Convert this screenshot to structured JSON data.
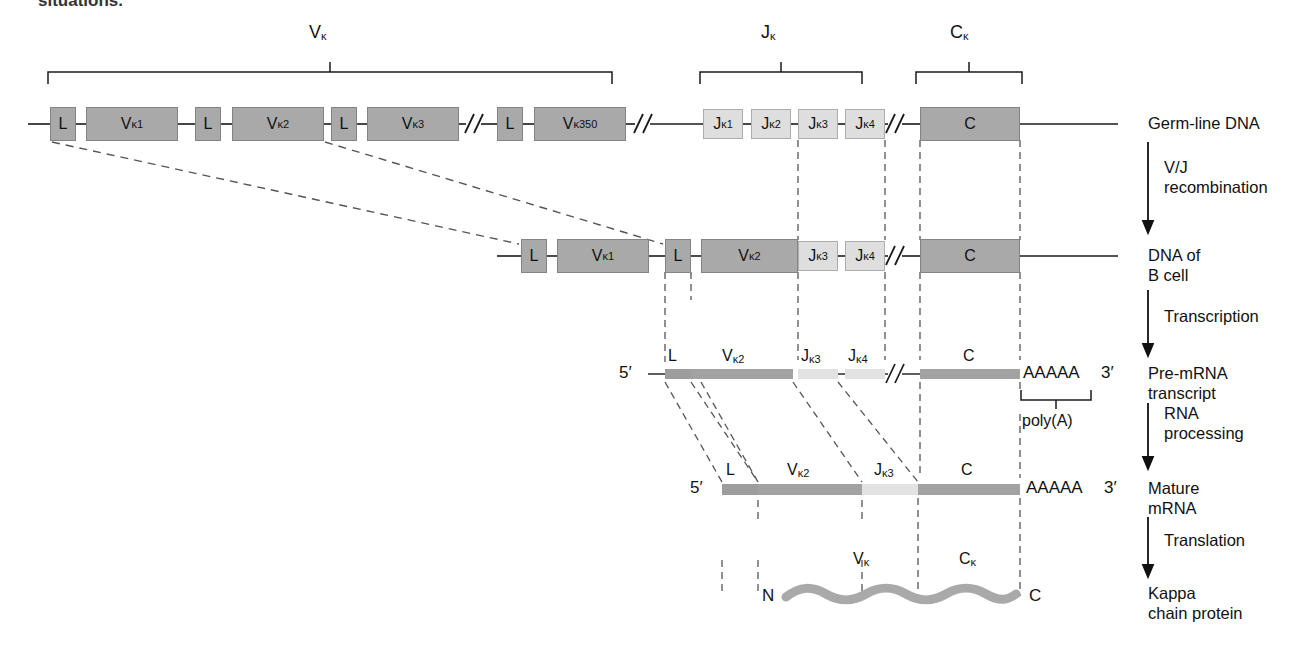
{
  "figure": {
    "page_fragment_top": "situations.",
    "kappa": "κ"
  },
  "brackets": [
    {
      "id": "v-bracket",
      "label": "V",
      "sub": "κ",
      "x1": 48,
      "x2": 612,
      "y": 72,
      "label_x": 316,
      "label_y": 30
    },
    {
      "id": "j-bracket",
      "label": "J",
      "sub": "κ",
      "x1": 700,
      "x2": 862,
      "y": 72,
      "label_x": 773,
      "label_y": 30
    },
    {
      "id": "c-bracket",
      "label": "C",
      "sub": "κ",
      "x1": 916,
      "x2": 1022,
      "y": 72,
      "label_x": 960,
      "label_y": 30
    },
    {
      "id": "polya-bracket",
      "label": "poly(A)",
      "sub": "",
      "x1": 1021,
      "x2": 1091,
      "y": 395,
      "label_x": 1026,
      "label_y": 408
    }
  ],
  "rows": [
    {
      "id": "germline-dna",
      "stage_label": "Germ-line DNA",
      "stage_label_lines": [
        "Germ-line DNA"
      ],
      "y": 124,
      "segments": [
        {
          "name": "L",
          "text": "L",
          "sub": "",
          "kind": "l",
          "x": 50,
          "w": 26,
          "h": 34
        },
        {
          "name": "Vk1",
          "text": "V",
          "sub": "κ1",
          "kind": "v",
          "x": 86,
          "w": 92,
          "h": 34
        },
        {
          "name": "L",
          "text": "L",
          "sub": "",
          "kind": "l",
          "x": 195,
          "w": 26,
          "h": 34
        },
        {
          "name": "Vk2",
          "text": "V",
          "sub": "κ2",
          "kind": "v",
          "x": 232,
          "w": 92,
          "h": 34
        },
        {
          "name": "L",
          "text": "L",
          "sub": "",
          "kind": "l",
          "x": 331,
          "w": 26,
          "h": 34
        },
        {
          "name": "Vk3",
          "text": "V",
          "sub": "κ3",
          "kind": "v",
          "x": 367,
          "w": 92,
          "h": 34
        },
        {
          "name": "L",
          "text": "L",
          "sub": "",
          "kind": "l",
          "x": 497,
          "w": 26,
          "h": 34
        },
        {
          "name": "Vk350",
          "text": "V",
          "sub": "κ350",
          "kind": "v",
          "x": 534,
          "w": 92,
          "h": 34
        },
        {
          "name": "Jk1",
          "text": "J",
          "sub": "κ1",
          "kind": "j",
          "x": 703,
          "w": 40,
          "h": 30
        },
        {
          "name": "Jk2",
          "text": "J",
          "sub": "κ2",
          "kind": "j",
          "x": 751,
          "w": 40,
          "h": 30
        },
        {
          "name": "Jk3",
          "text": "J",
          "sub": "κ3",
          "kind": "j",
          "x": 798,
          "w": 40,
          "h": 30
        },
        {
          "name": "Jk4",
          "text": "J",
          "sub": "κ4",
          "kind": "j",
          "x": 845,
          "w": 40,
          "h": 30
        },
        {
          "name": "C",
          "text": "C",
          "sub": "",
          "kind": "c",
          "x": 920,
          "w": 100,
          "h": 34
        }
      ],
      "breaks": [
        {
          "x": 472
        },
        {
          "x": 641
        },
        {
          "x": 893
        }
      ],
      "line_x1": 28,
      "line_x2": 1118
    },
    {
      "id": "dna-of-b-cell",
      "stage_label": "DNA of B cell",
      "stage_label_lines": [
        "DNA of",
        "B cell"
      ],
      "y": 256,
      "segments": [
        {
          "name": "L",
          "text": "L",
          "sub": "",
          "kind": "l",
          "x": 521,
          "w": 26,
          "h": 34
        },
        {
          "name": "Vk1",
          "text": "V",
          "sub": "κ1",
          "kind": "v",
          "x": 557,
          "w": 92,
          "h": 34
        },
        {
          "name": "L",
          "text": "L",
          "sub": "",
          "kind": "l",
          "x": 665,
          "w": 26,
          "h": 34
        },
        {
          "name": "Vk2",
          "text": "V",
          "sub": "κ2",
          "kind": "v",
          "x": 701,
          "w": 92,
          "h": 34
        },
        {
          "name": "Jk3",
          "text": "J",
          "sub": "κ3",
          "kind": "j",
          "x": 798,
          "w": 40,
          "h": 30
        },
        {
          "name": "Jk4",
          "text": "J",
          "sub": "κ4",
          "kind": "j",
          "x": 845,
          "w": 40,
          "h": 30
        },
        {
          "name": "C",
          "text": "C",
          "sub": "",
          "kind": "c",
          "x": 920,
          "w": 100,
          "h": 34
        }
      ],
      "breaks": [
        {
          "x": 893
        }
      ],
      "line_x1": 497,
      "line_x2": 1118
    },
    {
      "id": "pre-mrna-transcript",
      "stage_label": "Pre-mRNA transcript",
      "stage_label_lines": [
        "Pre-mRNA",
        "transcript"
      ],
      "y": 374,
      "five_prime": "5′",
      "three_prime": "3′",
      "polya_text": "AAAAA",
      "segments": [
        {
          "name": "L",
          "text": "L",
          "sub": "",
          "kind": "l",
          "x": 665,
          "w": 26,
          "h": 10
        },
        {
          "name": "Vk2",
          "text": "V",
          "sub": "κ2",
          "kind": "v",
          "x": 701,
          "w": 92,
          "h": 10
        },
        {
          "name": "Jk3",
          "text": "J",
          "sub": "κ3",
          "kind": "j",
          "x": 798,
          "w": 40,
          "h": 10
        },
        {
          "name": "Jk4",
          "text": "J",
          "sub": "κ4",
          "kind": "j",
          "x": 845,
          "w": 40,
          "h": 10
        },
        {
          "name": "C",
          "text": "C",
          "sub": "",
          "kind": "c",
          "x": 920,
          "w": 100,
          "h": 10
        }
      ],
      "breaks": [
        {
          "x": 893
        }
      ],
      "line_x1": 648,
      "line_x2": 1020
    },
    {
      "id": "mature-mrna",
      "stage_label": "Mature mRNA",
      "stage_label_lines": [
        "Mature",
        "mRNA"
      ],
      "y": 489,
      "five_prime": "5′",
      "three_prime": "3′",
      "polya_text": "AAAAA",
      "segments": [
        {
          "name": "L",
          "text": "L",
          "sub": "",
          "kind": "l",
          "x": 722,
          "w": 36,
          "h": 10
        },
        {
          "name": "Vk2",
          "text": "V",
          "sub": "κ2",
          "kind": "v",
          "x": 758,
          "w": 104,
          "h": 10
        },
        {
          "name": "Jk3",
          "text": "J",
          "sub": "κ3",
          "kind": "j",
          "x": 862,
          "w": 56,
          "h": 10
        },
        {
          "name": "C",
          "text": "C",
          "sub": "",
          "kind": "c",
          "x": 918,
          "w": 102,
          "h": 10
        }
      ],
      "breaks": [],
      "line_x1": 722,
      "line_x2": 1020
    },
    {
      "id": "kappa-chain-protein",
      "stage_label": "Kappa chain protein",
      "stage_label_lines": [
        "Kappa",
        "chain protein"
      ],
      "y": 594,
      "n_terminus": "N",
      "c_terminus": "C",
      "domains": [
        {
          "name": "Vk",
          "text": "V",
          "sub": "κ",
          "label_x": 862,
          "label_y": 560
        },
        {
          "name": "Ck",
          "text": "C",
          "sub": "κ",
          "label_x": 968,
          "label_y": 560
        }
      ]
    }
  ],
  "steps": [
    {
      "id": "vj-recombination",
      "lines": [
        "V/J",
        "recombination"
      ],
      "arrow_x": 1148,
      "y1": 142,
      "y2": 228,
      "label_x": 1164,
      "label_y": 158
    },
    {
      "id": "transcription",
      "lines": [
        "Transcription"
      ],
      "arrow_x": 1148,
      "y1": 290,
      "y2": 352,
      "label_x": 1164,
      "label_y": 306
    },
    {
      "id": "rna-processing",
      "lines": [
        "RNA",
        "processing"
      ],
      "arrow_x": 1148,
      "y1": 405,
      "y2": 463,
      "label_x": 1164,
      "label_y": 404
    },
    {
      "id": "translation",
      "lines": [
        "Translation"
      ],
      "arrow_x": 1148,
      "y1": 518,
      "y2": 573,
      "label_x": 1164,
      "label_y": 530
    }
  ],
  "stage_labels": [
    {
      "id": "germline-dna-label",
      "lines": [
        "Germ-line DNA"
      ],
      "x": 1148,
      "y": 115
    },
    {
      "id": "dna-b-cell-label",
      "lines": [
        "DNA of",
        "B cell"
      ],
      "x": 1148,
      "y": 247
    },
    {
      "id": "pre-mrna-label",
      "lines": [
        "Pre-mRNA",
        "transcript"
      ],
      "x": 1148,
      "y": 365
    },
    {
      "id": "mature-mrna-label",
      "lines": [
        "Mature",
        "mRNA"
      ],
      "x": 1148,
      "y": 480
    },
    {
      "id": "kappa-protein-label",
      "lines": [
        "Kappa",
        "chain protein"
      ],
      "x": 1148,
      "y": 585
    }
  ],
  "colors": {
    "v_segment": "#a9a9a9",
    "j_segment": "#dedede",
    "c_segment": "#a9a9a9",
    "l_segment": "#a9a9a9",
    "line": "#1a1a1a",
    "dashed": "#444444",
    "background": "#ffffff"
  }
}
